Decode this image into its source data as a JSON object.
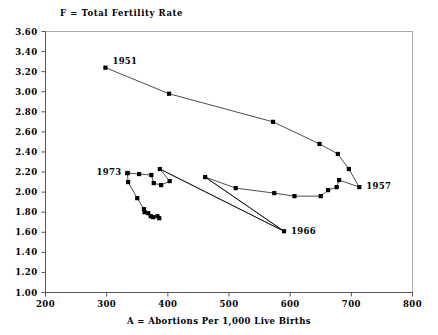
{
  "chart_data": {
    "type": "line",
    "title": "F = Total Fertility Rate",
    "xlabel": "A = Abortions Per 1,000 Live Births",
    "ylabel": "F = Total Fertility Rate",
    "xlim": [
      200,
      800
    ],
    "ylim": [
      1.0,
      3.6
    ],
    "xticks": [
      200,
      300,
      400,
      500,
      600,
      700,
      800
    ],
    "xtick_labels": [
      "200",
      "300",
      "400",
      "500",
      "600",
      "700",
      "800"
    ],
    "yticks": [
      1.0,
      1.2,
      1.4,
      1.6,
      1.8,
      2.0,
      2.2,
      2.4,
      2.6,
      2.8,
      3.0,
      3.2,
      3.4,
      3.6
    ],
    "ytick_labels": [
      "1.00",
      "1.20",
      "1.40",
      "1.60",
      "1.80",
      "2.00",
      "2.20",
      "2.40",
      "2.60",
      "2.80",
      "3.00",
      "3.20",
      "3.40",
      "3.60"
    ],
    "grid": false,
    "legend": "none",
    "marker": "filled-square",
    "line_color": "#000000",
    "marker_color": "#000000",
    "frame_color": "#aaaaaa",
    "axis_color": "#555555",
    "annotations": [
      {
        "label": "1951",
        "x": 298,
        "y": 3.24,
        "anchor": "start",
        "dx": 7,
        "dy": -4
      },
      {
        "label": "1957",
        "x": 713,
        "y": 2.05,
        "anchor": "start",
        "dx": 7,
        "dy": 2
      },
      {
        "label": "1966",
        "x": 590,
        "y": 1.61,
        "anchor": "start",
        "dx": 7,
        "dy": 3
      },
      {
        "label": "1973",
        "x": 334,
        "y": 2.19,
        "anchor": "end",
        "dx": -6,
        "dy": 2
      }
    ],
    "series": [
      {
        "name": "Trajectory 1951-1973",
        "points": [
          {
            "year": 1951,
            "x": 298,
            "y": 3.24
          },
          {
            "year": 1952,
            "x": 402,
            "y": 2.98
          },
          {
            "year": 1953,
            "x": 572,
            "y": 2.7
          },
          {
            "year": 1954,
            "x": 648,
            "y": 2.48
          },
          {
            "year": 1955,
            "x": 678,
            "y": 2.38
          },
          {
            "year": 1956,
            "x": 696,
            "y": 2.23
          },
          {
            "year": 1957,
            "x": 713,
            "y": 2.05
          },
          {
            "year": 1958,
            "x": 680,
            "y": 2.12
          },
          {
            "year": 1959,
            "x": 676,
            "y": 2.05
          },
          {
            "year": 1960,
            "x": 662,
            "y": 2.02
          },
          {
            "year": 1961,
            "x": 650,
            "y": 1.96
          },
          {
            "year": 1962,
            "x": 607,
            "y": 1.96
          },
          {
            "year": 1963,
            "x": 574,
            "y": 1.99
          },
          {
            "year": 1964,
            "x": 511,
            "y": 2.04
          },
          {
            "year": 1965,
            "x": 461,
            "y": 2.15
          },
          {
            "year": 1966,
            "x": 590,
            "y": 1.61
          },
          {
            "year": 1967,
            "x": 387,
            "y": 2.23
          },
          {
            "year": 1968,
            "x": 403,
            "y": 2.11
          },
          {
            "year": 1969,
            "x": 389,
            "y": 2.07
          },
          {
            "year": 1970,
            "x": 377,
            "y": 2.09
          },
          {
            "year": 1971,
            "x": 373,
            "y": 2.17
          },
          {
            "year": 1972,
            "x": 353,
            "y": 2.18
          },
          {
            "year": 1973,
            "x": 334,
            "y": 2.19
          }
        ]
      },
      {
        "name": "Trajectory 1973 onward (declining)",
        "points": [
          {
            "x": 334,
            "y": 2.19
          },
          {
            "x": 335,
            "y": 2.1
          },
          {
            "x": 350,
            "y": 1.94
          },
          {
            "x": 361,
            "y": 1.83
          },
          {
            "x": 362,
            "y": 1.8
          },
          {
            "x": 368,
            "y": 1.79
          },
          {
            "x": 372,
            "y": 1.76
          },
          {
            "x": 376,
            "y": 1.75
          },
          {
            "x": 383,
            "y": 1.76
          },
          {
            "x": 386,
            "y": 1.74
          }
        ]
      }
    ],
    "connector_lines": [
      {
        "from": {
          "x": 461,
          "y": 2.15
        },
        "to": {
          "x": 590,
          "y": 1.61
        }
      },
      {
        "from": {
          "x": 590,
          "y": 1.61
        },
        "to": {
          "x": 387,
          "y": 2.23
        }
      }
    ]
  }
}
